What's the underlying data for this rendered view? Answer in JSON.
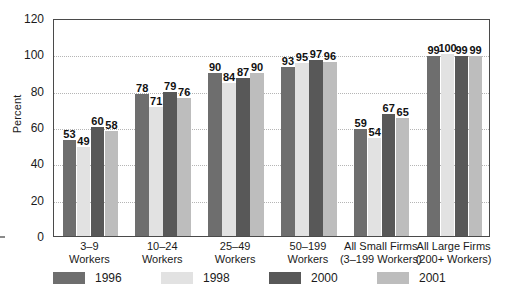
{
  "chart_data": {
    "type": "bar",
    "title": "",
    "xlabel": "",
    "ylabel": "Percent",
    "ylim": [
      0,
      120
    ],
    "yticks": [
      0,
      20,
      40,
      60,
      80,
      100,
      120
    ],
    "grid": true,
    "legend_position": "bottom",
    "categories": [
      {
        "line1": "3–9",
        "line2": "Workers"
      },
      {
        "line1": "10–24",
        "line2": "Workers"
      },
      {
        "line1": "25–49",
        "line2": "Workers"
      },
      {
        "line1": "50–199",
        "line2": "Workers"
      },
      {
        "line1": "All Small Firms",
        "line2": "(3–199 Workers)"
      },
      {
        "line1": "All Large Firms",
        "line2": "(200+ Workers)"
      }
    ],
    "series": [
      {
        "name": "1996",
        "color": "#6e6e6e",
        "values": [
          53,
          78,
          90,
          93,
          59,
          99
        ]
      },
      {
        "name": "1998",
        "color": "#e2e2e2",
        "values": [
          49,
          71,
          84,
          95,
          54,
          100
        ]
      },
      {
        "name": "2000",
        "color": "#585858",
        "values": [
          60,
          79,
          87,
          97,
          67,
          99
        ]
      },
      {
        "name": "2001",
        "color": "#bdbdbd",
        "values": [
          58,
          76,
          90,
          96,
          65,
          99
        ]
      }
    ]
  },
  "axis": {
    "y_title": "Percent"
  }
}
